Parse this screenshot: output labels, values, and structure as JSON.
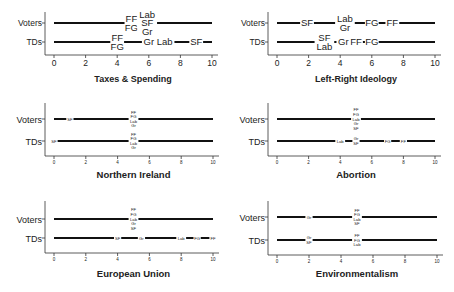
{
  "chart_data": [
    {
      "type": "scatter",
      "title": "Taxes & Spending",
      "categories": [
        "Voters",
        "TDs"
      ],
      "xlim": [
        0,
        10
      ],
      "xticks": [
        0,
        2,
        4,
        6,
        8,
        10
      ],
      "label_size": "large",
      "series": [
        {
          "name": "Voters",
          "points": [
            {
              "party": "FF",
              "x": 4.9
            },
            {
              "party": "FG",
              "x": 4.9
            },
            {
              "party": "Lab",
              "x": 5.9
            },
            {
              "party": "SF",
              "x": 5.9
            },
            {
              "party": "Gr",
              "x": 5.9
            }
          ]
        },
        {
          "name": "TDs",
          "points": [
            {
              "party": "FF",
              "x": 4.0
            },
            {
              "party": "FG",
              "x": 4.0
            },
            {
              "party": "Gr",
              "x": 6.0
            },
            {
              "party": "Lab",
              "x": 7.0
            },
            {
              "party": "SF",
              "x": 9.0
            }
          ]
        }
      ]
    },
    {
      "type": "scatter",
      "title": "Left-Right Ideology",
      "categories": [
        "Voters",
        "TDs"
      ],
      "xlim": [
        0,
        10
      ],
      "xticks": [
        0,
        2,
        4,
        6,
        8,
        10
      ],
      "label_size": "large",
      "series": [
        {
          "name": "Voters",
          "points": [
            {
              "party": "SF",
              "x": 1.9
            },
            {
              "party": "Lab",
              "x": 4.3
            },
            {
              "party": "Gr",
              "x": 4.3
            },
            {
              "party": "FG",
              "x": 6.0
            },
            {
              "party": "FF",
              "x": 7.3
            }
          ]
        },
        {
          "name": "TDs",
          "points": [
            {
              "party": "SF",
              "x": 3.0
            },
            {
              "party": "Lab",
              "x": 3.0
            },
            {
              "party": "Gr",
              "x": 4.2
            },
            {
              "party": "FF",
              "x": 5.0
            },
            {
              "party": "FG",
              "x": 6.0
            }
          ]
        }
      ]
    },
    {
      "type": "scatter",
      "title": "Northern Ireland",
      "categories": [
        "Voters",
        "TDs"
      ],
      "xlim": [
        0,
        10
      ],
      "xticks": [
        0,
        2,
        4,
        6,
        8,
        10
      ],
      "label_size": "small",
      "series": [
        {
          "name": "Voters",
          "points": [
            {
              "party": "SF",
              "x": 1.0
            },
            {
              "party": "FF",
              "x": 5.0
            },
            {
              "party": "FG",
              "x": 5.0
            },
            {
              "party": "Lab",
              "x": 5.0
            },
            {
              "party": "Gr",
              "x": 5.0
            }
          ]
        },
        {
          "name": "TDs",
          "points": [
            {
              "party": "SF",
              "x": 0.0
            },
            {
              "party": "FF",
              "x": 5.0
            },
            {
              "party": "FG",
              "x": 5.0
            },
            {
              "party": "Lab",
              "x": 5.0
            },
            {
              "party": "Gr",
              "x": 5.0
            }
          ]
        }
      ]
    },
    {
      "type": "scatter",
      "title": "Abortion",
      "categories": [
        "Voters",
        "TDs"
      ],
      "xlim": [
        0,
        10
      ],
      "xticks": [
        0,
        2,
        4,
        6,
        8,
        10
      ],
      "label_size": "small",
      "series": [
        {
          "name": "Voters",
          "points": [
            {
              "party": "FF",
              "x": 5.0
            },
            {
              "party": "FG",
              "x": 5.0
            },
            {
              "party": "Lab",
              "x": 5.0
            },
            {
              "party": "Gr",
              "x": 5.0
            },
            {
              "party": "SF",
              "x": 5.0
            }
          ]
        },
        {
          "name": "TDs",
          "points": [
            {
              "party": "Lab",
              "x": 4.0
            },
            {
              "party": "Gr",
              "x": 5.0
            },
            {
              "party": "SF",
              "x": 5.0
            },
            {
              "party": "FG",
              "x": 7.0
            },
            {
              "party": "FF",
              "x": 8.0
            }
          ]
        }
      ]
    },
    {
      "type": "scatter",
      "title": "European Union",
      "categories": [
        "Voters",
        "TDs"
      ],
      "xlim": [
        0,
        10
      ],
      "xticks": [
        0,
        2,
        4,
        6,
        8,
        10
      ],
      "label_size": "small",
      "series": [
        {
          "name": "Voters",
          "points": [
            {
              "party": "FF",
              "x": 5.0
            },
            {
              "party": "FG",
              "x": 5.0
            },
            {
              "party": "Lab",
              "x": 5.0
            },
            {
              "party": "Gr",
              "x": 5.0
            },
            {
              "party": "SF",
              "x": 5.0
            }
          ]
        },
        {
          "name": "TDs",
          "points": [
            {
              "party": "SF",
              "x": 4.0
            },
            {
              "party": "Gr",
              "x": 5.5
            },
            {
              "party": "Lab",
              "x": 8.0
            },
            {
              "party": "FG",
              "x": 9.0
            },
            {
              "party": "FF",
              "x": 10.0
            }
          ]
        }
      ]
    },
    {
      "type": "scatter",
      "title": "Environmentalism",
      "categories": [
        "Voters",
        "TDs"
      ],
      "xlim": [
        0,
        10
      ],
      "xticks": [
        0,
        2,
        4,
        6,
        8,
        10
      ],
      "label_size": "small",
      "series": [
        {
          "name": "Voters",
          "points": [
            {
              "party": "Gr",
              "x": 2.0
            },
            {
              "party": "FF",
              "x": 5.0
            },
            {
              "party": "FG",
              "x": 5.0
            },
            {
              "party": "Lab",
              "x": 5.0
            },
            {
              "party": "SF",
              "x": 5.0
            }
          ]
        },
        {
          "name": "TDs",
          "points": [
            {
              "party": "Gr",
              "x": 2.0
            },
            {
              "party": "SF",
              "x": 2.0
            },
            {
              "party": "FF",
              "x": 5.0
            },
            {
              "party": "FG",
              "x": 5.0
            },
            {
              "party": "Lab",
              "x": 5.0
            }
          ]
        }
      ]
    }
  ],
  "panels": [
    {
      "title": "Taxes & Spending",
      "row_labels": [
        "Voters",
        "TDs"
      ]
    },
    {
      "title": "Left-Right Ideology",
      "row_labels": [
        "Voters",
        "TDs"
      ]
    },
    {
      "title": "Northern Ireland",
      "row_labels": [
        "Voters",
        "TDs"
      ]
    },
    {
      "title": "Abortion",
      "row_labels": [
        "Voters",
        "TDs"
      ]
    },
    {
      "title": "European Union",
      "row_labels": [
        "Voters",
        "TDs"
      ]
    },
    {
      "title": "Environmentalism",
      "row_labels": [
        "Voters",
        "TDs"
      ]
    }
  ],
  "caption": ""
}
